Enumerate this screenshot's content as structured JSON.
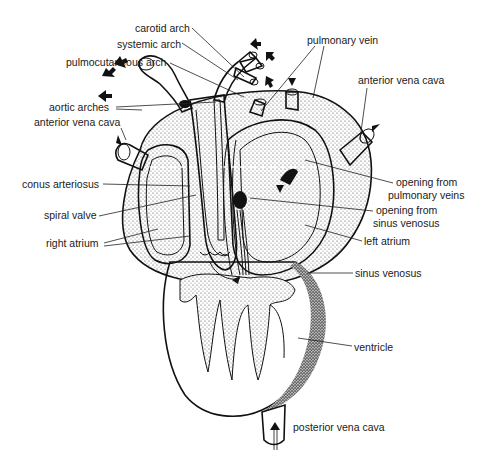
{
  "figure": {
    "labels": {
      "carotid_arch": "carotid arch",
      "systemic_arch": "systemic arch",
      "pulmocutaneous_arch": "pulmocutaneous arch",
      "aortic_arches": "aortic arches",
      "anterior_vena_cava_left": "anterior vena cava",
      "conus_arteriosus": "conus arteriosus",
      "spiral_valve": "spiral valve",
      "right_atrium": "right atrium",
      "pulmonary_vein": "pulmonary vein",
      "anterior_vena_cava_right": "anterior vena cava",
      "opening_pulmonary_1": "opening from",
      "opening_pulmonary_2": "pulmonary veins",
      "opening_sinus_1": "opening from",
      "opening_sinus_2": "sinus venosus",
      "left_atrium": "left atrium",
      "sinus_venosus": "sinus venosus",
      "ventricle": "ventricle",
      "posterior_vena_cava": "posterior vena cava"
    },
    "colors": {
      "ink": "#111111",
      "background": "#ffffff"
    }
  }
}
